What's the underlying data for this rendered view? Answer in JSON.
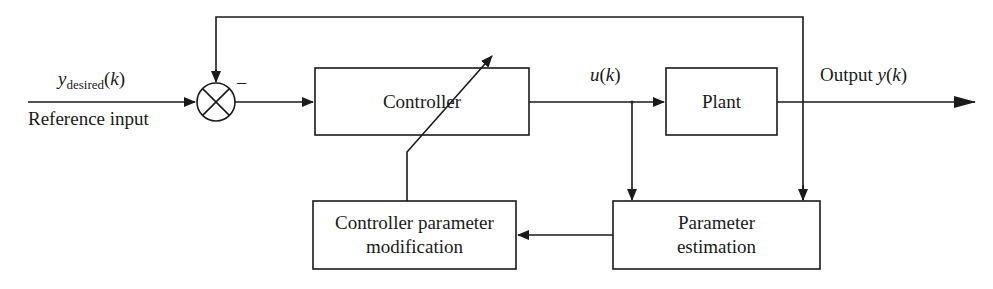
{
  "diagram": {
    "type": "block-diagram",
    "title": "",
    "blocks": [
      {
        "id": "controller",
        "label": "Controller"
      },
      {
        "id": "plant",
        "label": "Plant"
      },
      {
        "id": "param_mod",
        "label_line1": "Controller parameter",
        "label_line2": "modification"
      },
      {
        "id": "param_est",
        "label_line1": "Parameter",
        "label_line2": "estimation"
      }
    ],
    "summing_junction": {
      "symbol": "⊗",
      "feedback_sign": "−"
    },
    "signals": {
      "reference": {
        "var": "y",
        "subscript": "desired",
        "arg": "(k)",
        "caption": "Reference input"
      },
      "control": {
        "var": "u",
        "arg": "(k)"
      },
      "output": {
        "prefix": "Output ",
        "var": "y",
        "arg": "(k)"
      }
    },
    "connections": [
      "Reference input -> summing junction",
      "summing junction -> Controller",
      "Controller -> Plant (u(k))",
      "Plant -> Output y(k)",
      "Output y(k) -> summing junction (negative feedback)",
      "u(k) -> Parameter estimation",
      "Output y(k) -> Parameter estimation",
      "Parameter estimation -> Controller parameter modification",
      "Controller parameter modification -> Controller (adjustable gain arrow)"
    ]
  }
}
